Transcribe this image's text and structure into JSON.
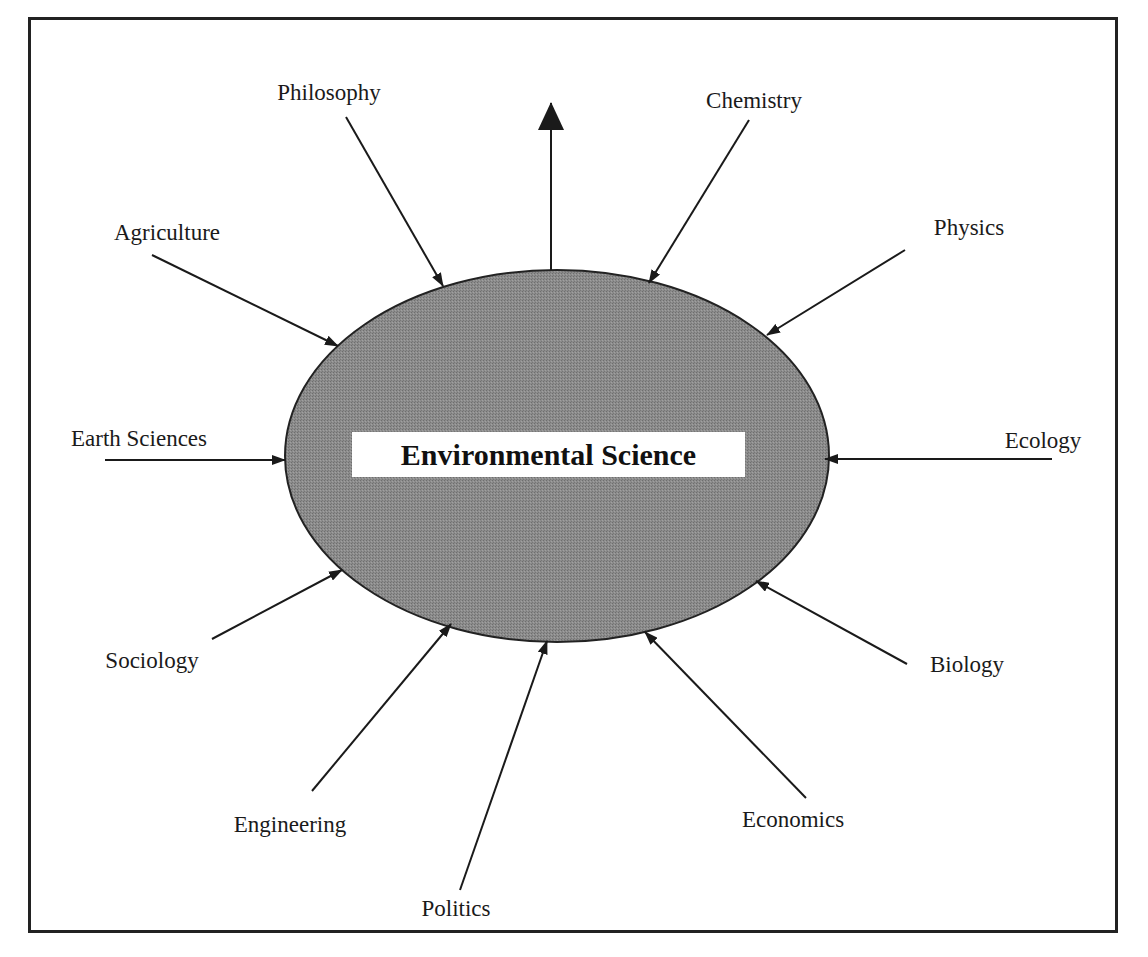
{
  "diagram": {
    "title": "Environmental Science",
    "center": {
      "cx": 557,
      "cy": 456,
      "rx": 272,
      "ry": 186,
      "fill": "#8a8a8a",
      "stroke": "#222222"
    },
    "nodes": [
      {
        "id": "philosophy",
        "label": "Philosophy",
        "lx": 329,
        "ly": 93,
        "from": [
          346,
          117
        ],
        "to": [
          443,
          286
        ]
      },
      {
        "id": "chemistry",
        "label": "Chemistry",
        "lx": 754,
        "ly": 101,
        "from": [
          749,
          120
        ],
        "to": [
          649,
          283
        ]
      },
      {
        "id": "agriculture",
        "label": "Agriculture",
        "lx": 167,
        "ly": 233,
        "from": [
          152,
          255
        ],
        "to": [
          338,
          346
        ]
      },
      {
        "id": "physics",
        "label": "Physics",
        "lx": 969,
        "ly": 228,
        "from": [
          905,
          250
        ],
        "to": [
          767,
          335
        ]
      },
      {
        "id": "earth-sciences",
        "label": "Earth Sciences",
        "lx": 139,
        "ly": 439,
        "from": [
          105,
          460
        ],
        "to": [
          285,
          460
        ]
      },
      {
        "id": "ecology",
        "label": "Ecology",
        "lx": 1043,
        "ly": 441,
        "from": [
          1052,
          459
        ],
        "to": [
          825,
          459
        ]
      },
      {
        "id": "sociology",
        "label": "Sociology",
        "lx": 152,
        "ly": 661,
        "from": [
          212,
          639
        ],
        "to": [
          342,
          570
        ]
      },
      {
        "id": "biology",
        "label": "Biology",
        "lx": 967,
        "ly": 665,
        "from": [
          907,
          664
        ],
        "to": [
          756,
          581
        ]
      },
      {
        "id": "engineering",
        "label": "Engineering",
        "lx": 290,
        "ly": 825,
        "from": [
          312,
          791
        ],
        "to": [
          451,
          624
        ]
      },
      {
        "id": "economics",
        "label": "Economics",
        "lx": 793,
        "ly": 820,
        "from": [
          806,
          798
        ],
        "to": [
          645,
          632
        ]
      },
      {
        "id": "politics",
        "label": "Politics",
        "lx": 456,
        "ly": 909,
        "from": [
          460,
          890
        ],
        "to": [
          547,
          641
        ]
      }
    ],
    "outgoing_arrow": {
      "from": [
        551,
        270
      ],
      "to": [
        551,
        103
      ]
    }
  }
}
